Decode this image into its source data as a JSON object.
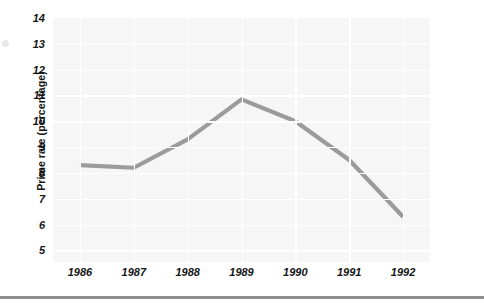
{
  "chart_data": {
    "type": "line",
    "title": "",
    "xlabel": "",
    "ylabel": "Prime rate (percentage)",
    "categories": [
      "1986",
      "1987",
      "1988",
      "1989",
      "1990",
      "1991",
      "1992"
    ],
    "values": [
      8.3,
      8.2,
      9.3,
      10.85,
      10.0,
      8.5,
      6.3
    ],
    "series": [
      {
        "name": "Prime rate",
        "values": [
          8.3,
          8.2,
          9.3,
          10.85,
          10.0,
          8.5,
          6.3
        ],
        "color": "#9b9b9b"
      }
    ],
    "ytick_labels": [
      "14",
      "13",
      "12",
      "11",
      "10",
      "9",
      "8",
      "7",
      "6",
      "5"
    ],
    "ytick_values": [
      14,
      13,
      12,
      11,
      10,
      9,
      8,
      7,
      6,
      5
    ],
    "ylim": [
      4.55,
      14.0
    ],
    "xtick_labels": [
      "1986",
      "1987",
      "1988",
      "1989",
      "1990",
      "1991",
      "1992"
    ],
    "grid": "both",
    "grid_color": "#ffffff",
    "plot_background": "#f6f6f6",
    "legend": "none",
    "annotations": []
  },
  "figure": {
    "y_axis_title": "Prime rate (percentage)",
    "line_color": "#9b9b9b",
    "background_color": "#ffffff",
    "rule_color": "#8f8f8f"
  }
}
